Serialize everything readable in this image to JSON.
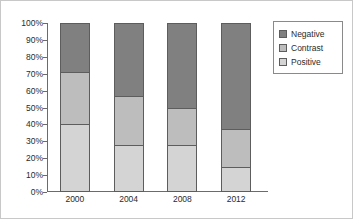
{
  "chart_data": {
    "type": "bar",
    "subtype": "stacked-100-percent",
    "title": "",
    "xlabel": "",
    "ylabel": "",
    "categories": [
      "2000",
      "2004",
      "2008",
      "2012"
    ],
    "series": [
      {
        "name": "Positive",
        "color": "#d4d4d4",
        "values": [
          40,
          28,
          28,
          15
        ]
      },
      {
        "name": "Contrast",
        "color": "#bdbdbd",
        "values": [
          31,
          29,
          22,
          22
        ]
      },
      {
        "name": "Negative",
        "color": "#808080",
        "values": [
          29,
          43,
          50,
          63
        ]
      }
    ],
    "stack_order_bottom_to_top": [
      "Positive",
      "Contrast",
      "Negative"
    ],
    "ylim": [
      0,
      100
    ],
    "y_ticks": [
      "0%",
      "10%",
      "20%",
      "30%",
      "40%",
      "50%",
      "60%",
      "70%",
      "80%",
      "90%",
      "100%"
    ],
    "y_tick_values": [
      0,
      10,
      20,
      30,
      40,
      50,
      60,
      70,
      80,
      90,
      100
    ],
    "grid": false,
    "legend_position": "right",
    "legend": [
      {
        "label": "Negative",
        "color": "#808080"
      },
      {
        "label": "Contrast",
        "color": "#bdbdbd"
      },
      {
        "label": "Positive",
        "color": "#d4d4d4"
      }
    ],
    "colors": {
      "negative": "#808080",
      "contrast": "#bdbdbd",
      "positive": "#d4d4d4",
      "axis": "#6b6b6b",
      "bar_outline": "#5d5d5d",
      "frame": "#c8c8c8",
      "text": "#2b2b2b"
    }
  }
}
